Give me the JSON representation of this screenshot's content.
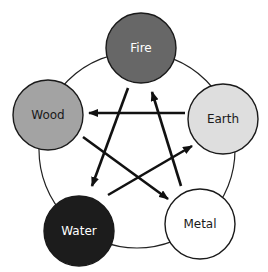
{
  "diagram": {
    "ring": {
      "cx": 137,
      "cy": 150,
      "r": 98,
      "stroke": "#222222"
    },
    "nodes": [
      {
        "id": "fire",
        "label": "Fire",
        "cx": 141,
        "cy": 48,
        "r": 35,
        "fill": "#676767",
        "text_color": "#ffffff"
      },
      {
        "id": "wood",
        "label": "Wood",
        "cx": 48,
        "cy": 115,
        "r": 35,
        "fill": "#a3a3a3",
        "text_color": "#1a1a1a"
      },
      {
        "id": "earth",
        "label": "Earth",
        "cx": 223,
        "cy": 119,
        "r": 35,
        "fill": "#dedede",
        "text_color": "#1a1a1a"
      },
      {
        "id": "water",
        "label": "Water",
        "cx": 79,
        "cy": 231,
        "r": 35,
        "fill": "#1c1c1c",
        "text_color": "#ffffff"
      },
      {
        "id": "metal",
        "label": "Metal",
        "cx": 200,
        "cy": 224,
        "r": 35,
        "fill": "#ffffff",
        "text_color": "#1a1a1a"
      }
    ],
    "arrows": [
      {
        "from": "fire",
        "to": "water",
        "x1": 128,
        "y1": 88,
        "x2": 92,
        "y2": 186
      },
      {
        "from": "earth",
        "to": "wood",
        "x1": 185,
        "y1": 113,
        "x2": 89,
        "y2": 113
      },
      {
        "from": "wood",
        "to": "metal",
        "x1": 83,
        "y1": 137,
        "x2": 168,
        "y2": 199
      },
      {
        "from": "water",
        "to": "earth",
        "x1": 108,
        "y1": 195,
        "x2": 192,
        "y2": 146
      },
      {
        "from": "metal",
        "to": "fire",
        "x1": 181,
        "y1": 186,
        "x2": 152,
        "y2": 92
      }
    ]
  }
}
